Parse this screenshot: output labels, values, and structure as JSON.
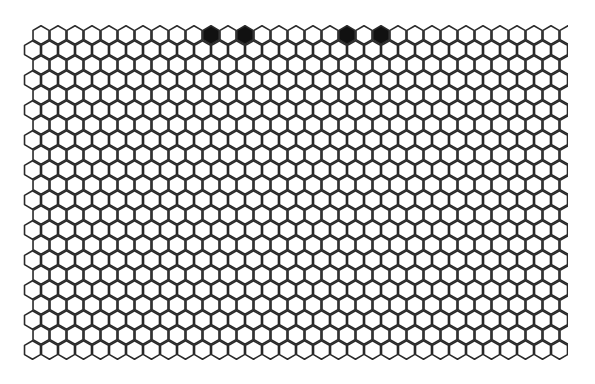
{
  "game": {
    "type": "hex-grid-board",
    "rows": 22,
    "cols": 32,
    "hex_width": 17,
    "row_step": 15,
    "origin_x_even": 41,
    "origin_x_odd": 32.5,
    "origin_y": 35,
    "clip_right": 568,
    "colors": {
      "background": "#ffffff",
      "cell_fill": "#ffffff",
      "cell_stroke": "#2a2a2a",
      "filled_cell": "#111111"
    },
    "filled_cells": [
      {
        "row": 0,
        "col": 10
      },
      {
        "row": 0,
        "col": 12
      },
      {
        "row": 0,
        "col": 18
      },
      {
        "row": 0,
        "col": 20
      }
    ]
  }
}
